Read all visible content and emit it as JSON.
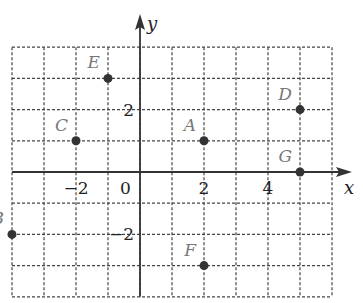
{
  "chart_data": {
    "type": "scatter",
    "title": "",
    "xlabel": "x",
    "ylabel": "y",
    "xlim": [
      -4,
      6
    ],
    "ylim": [
      -4,
      4
    ],
    "grid": true,
    "x_tick_labels": [
      {
        "value": -2,
        "label": "−2"
      },
      {
        "value": 0,
        "label": "0"
      },
      {
        "value": 2,
        "label": "2"
      },
      {
        "value": 4,
        "label": "4"
      }
    ],
    "y_tick_labels": [
      {
        "value": 2,
        "label": "2"
      },
      {
        "value": -2,
        "label": "−2"
      }
    ],
    "points": [
      {
        "label": "A",
        "x": 2,
        "y": 1
      },
      {
        "label": "B",
        "x": -4,
        "y": -2
      },
      {
        "label": "C",
        "x": -2,
        "y": 1
      },
      {
        "label": "D",
        "x": 5,
        "y": 2
      },
      {
        "label": "E",
        "x": -1,
        "y": 3
      },
      {
        "label": "F",
        "x": 2,
        "y": -3
      },
      {
        "label": "G",
        "x": 5,
        "y": 0
      }
    ]
  }
}
